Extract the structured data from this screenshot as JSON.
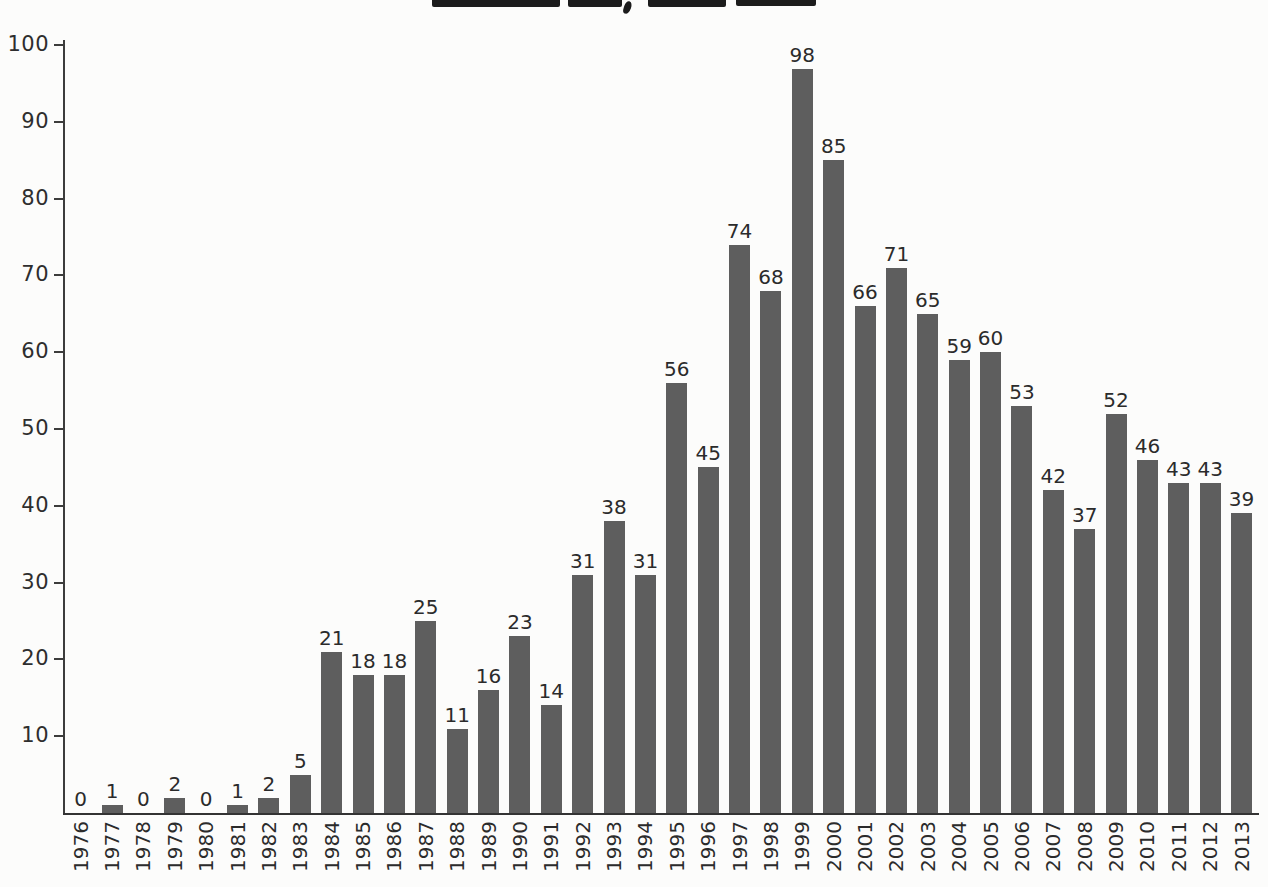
{
  "page": {
    "background_color": "#fcfcfb",
    "note": "scanned printed bar chart; title cropped off at top edge of image"
  },
  "chart_data": {
    "type": "bar",
    "title": "",
    "xlabel": "",
    "ylabel": "",
    "categories": [
      "1976",
      "1977",
      "1978",
      "1979",
      "1980",
      "1981",
      "1982",
      "1983",
      "1984",
      "1985",
      "1986",
      "1987",
      "1988",
      "1989",
      "1990",
      "1991",
      "1992",
      "1993",
      "1994",
      "1995",
      "1996",
      "1997",
      "1998",
      "1999",
      "2000",
      "2001",
      "2002",
      "2003",
      "2004",
      "2005",
      "2006",
      "2007",
      "2008",
      "2009",
      "2010",
      "2011",
      "2012",
      "2013"
    ],
    "values": [
      0,
      1,
      0,
      2,
      0,
      1,
      2,
      5,
      21,
      18,
      18,
      25,
      11,
      16,
      23,
      14,
      31,
      38,
      31,
      56,
      45,
      74,
      68,
      98,
      85,
      66,
      71,
      65,
      59,
      60,
      53,
      42,
      37,
      52,
      46,
      43,
      43,
      39
    ],
    "value_labels_shown": true,
    "ylim": [
      0,
      100
    ],
    "yticks": [
      10,
      20,
      30,
      40,
      50,
      60,
      70,
      80,
      90,
      100
    ],
    "x_tick_label_rotation": "vertical-bottom-to-top",
    "grid": false,
    "legend": null,
    "bar_color": "#5e5e5e",
    "axis_color": "#3c3c3c",
    "text_color": "#2b2b2b"
  }
}
